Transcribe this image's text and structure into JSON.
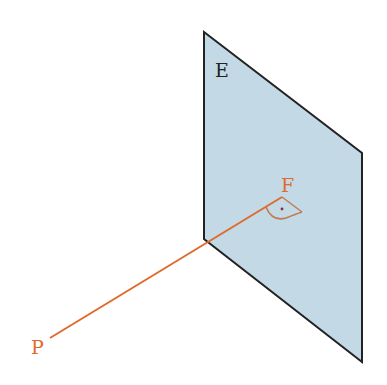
{
  "diagram": {
    "plane": {
      "label": "E",
      "fill": "#c3d9e6",
      "stroke": "#222222"
    },
    "foot_point": {
      "label": "F",
      "color": "#e06a2a"
    },
    "point": {
      "label": "P",
      "color": "#e06a2a"
    },
    "right_angle_marker": {
      "color": "#c07a50"
    }
  }
}
